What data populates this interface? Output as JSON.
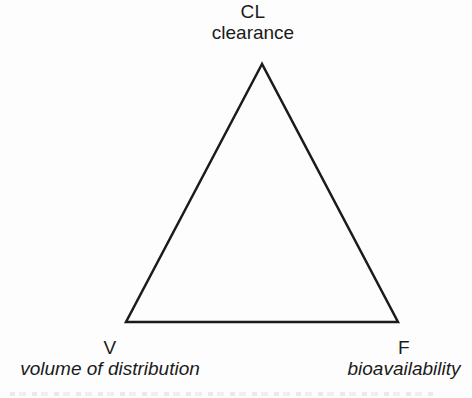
{
  "diagram": {
    "title_symbol_top": "CL",
    "vertices": {
      "top": {
        "symbol": "CL",
        "label": "clearance"
      },
      "bottom_left": {
        "symbol": "V",
        "label": "volume of distribution"
      },
      "bottom_right": {
        "symbol": "F",
        "label": "bioavailability"
      }
    },
    "triangle": {
      "points": "262,64 126,322 398,322",
      "stroke_width": "2.5"
    },
    "colors": {
      "line": "#1b1b1b",
      "text": "#1b1b1b",
      "background": "#fdfdfd"
    }
  }
}
